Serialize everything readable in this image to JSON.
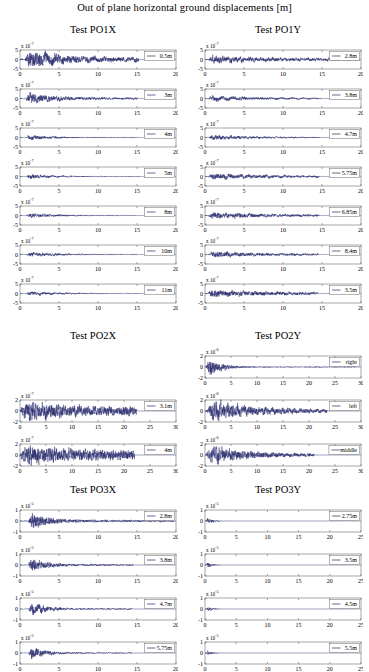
{
  "figure": {
    "title": "Out of plane horizontal ground displacements [m]",
    "axis_color": "#6b6b6b",
    "trace_color": "#27286b",
    "background": "#ffffff",
    "exp_prefix": "x 10"
  },
  "sections": [
    {
      "id": "po1x",
      "title": "Test PO1X",
      "column": "left",
      "xlabel": "",
      "ylabel": "",
      "xlim": [
        0,
        20
      ],
      "xticks": [
        0,
        5,
        10,
        15,
        20
      ],
      "ylim": [
        -5,
        5
      ],
      "yticks": [
        -5,
        0,
        5
      ],
      "exponent": "-7",
      "panels": [
        {
          "legend": "0.5m",
          "amp": 1.0,
          "burst_start": 0.7,
          "burst_peak": 1.1,
          "decay": 4.0,
          "tail": 0.22,
          "end": 15.2,
          "seed": 11
        },
        {
          "legend": "3m",
          "amp": 0.62,
          "burst_start": 0.8,
          "burst_peak": 1.2,
          "decay": 3.0,
          "tail": 0.16,
          "end": 15.1,
          "seed": 23
        },
        {
          "legend": "4m",
          "amp": 0.3,
          "burst_start": 0.8,
          "burst_peak": 1.2,
          "decay": 3.0,
          "tail": 0.12,
          "end": 15.0,
          "seed": 37
        },
        {
          "legend": "5m",
          "amp": 0.26,
          "burst_start": 0.8,
          "burst_peak": 1.2,
          "decay": 3.0,
          "tail": 0.13,
          "end": 15.3,
          "seed": 41
        },
        {
          "legend": "8m",
          "amp": 0.24,
          "burst_start": 0.8,
          "burst_peak": 1.3,
          "decay": 3.5,
          "tail": 0.14,
          "end": 15.1,
          "seed": 59
        },
        {
          "legend": "10m",
          "amp": 0.26,
          "burst_start": 0.8,
          "burst_peak": 1.3,
          "decay": 3.5,
          "tail": 0.15,
          "end": 15.0,
          "seed": 67
        },
        {
          "legend": "11m",
          "amp": 0.24,
          "burst_start": 0.8,
          "burst_peak": 1.3,
          "decay": 3.5,
          "tail": 0.14,
          "end": 15.2,
          "seed": 73
        }
      ]
    },
    {
      "id": "po1y",
      "title": "Test PO1Y",
      "column": "right",
      "xlabel": "",
      "ylabel": "",
      "xlim": [
        0,
        20
      ],
      "xticks": [
        0,
        5,
        10,
        15,
        20
      ],
      "ylim": [
        -5,
        5
      ],
      "yticks": [
        -5,
        0,
        5
      ],
      "exponent": "-7",
      "panels": [
        {
          "legend": "2.8m",
          "amp": 0.45,
          "burst_start": 0.5,
          "burst_peak": 1.0,
          "decay": 5.0,
          "tail": 0.3,
          "end": 19.8,
          "seed": 101
        },
        {
          "legend": "3.8m",
          "amp": 0.3,
          "burst_start": 0.5,
          "burst_peak": 1.0,
          "decay": 5.0,
          "tail": 0.22,
          "end": 14.8,
          "seed": 113
        },
        {
          "legend": "4.7m",
          "amp": 0.28,
          "burst_start": 0.5,
          "burst_peak": 1.0,
          "decay": 5.0,
          "tail": 0.2,
          "end": 14.7,
          "seed": 127
        },
        {
          "legend": "5.75m",
          "amp": 0.34,
          "burst_start": 0.5,
          "burst_peak": 1.0,
          "decay": 6.0,
          "tail": 0.26,
          "end": 14.6,
          "seed": 139
        },
        {
          "legend": "6.85m",
          "amp": 0.36,
          "burst_start": 0.5,
          "burst_peak": 1.0,
          "decay": 6.0,
          "tail": 0.27,
          "end": 14.6,
          "seed": 151
        },
        {
          "legend": "8.4m",
          "amp": 0.33,
          "burst_start": 0.5,
          "burst_peak": 1.0,
          "decay": 6.0,
          "tail": 0.25,
          "end": 14.5,
          "seed": 163
        },
        {
          "legend": "3.5m",
          "amp": 0.4,
          "burst_start": 0.4,
          "burst_peak": 0.9,
          "decay": 7.0,
          "tail": 0.3,
          "end": 14.5,
          "seed": 179
        }
      ]
    },
    {
      "id": "po2x",
      "title": "Test PO2X",
      "column": "left",
      "xlabel": "",
      "ylabel": "",
      "xlim": [
        0,
        30
      ],
      "xticks": [
        0,
        5,
        10,
        15,
        20,
        25,
        30
      ],
      "ylim": [
        -2,
        2
      ],
      "yticks": [
        -2,
        0,
        2
      ],
      "exponent": "-7",
      "panels": [
        {
          "legend": "3.1m",
          "amp": 0.95,
          "burst_start": 0.3,
          "burst_peak": 1.5,
          "decay": 6.0,
          "tail": 0.42,
          "end": 22.5,
          "seed": 211
        },
        {
          "legend": "4m",
          "amp": 0.95,
          "burst_start": 0.3,
          "burst_peak": 1.5,
          "decay": 6.5,
          "tail": 0.45,
          "end": 22.0,
          "seed": 223
        }
      ]
    },
    {
      "id": "po2y",
      "title": "Test PO2Y",
      "column": "right",
      "xlabel": "",
      "ylabel": "",
      "xlim": [
        0,
        30
      ],
      "xticks": [
        0,
        5,
        10,
        15,
        20,
        25,
        30
      ],
      "ylim": [
        -2,
        2
      ],
      "yticks": [
        -2,
        0,
        2
      ],
      "exponent": "-6",
      "panels": [
        {
          "legend": "right",
          "amp": 0.9,
          "burst_start": 0.2,
          "burst_peak": 0.9,
          "decay": 2.2,
          "tail": 0.05,
          "end": 29.0,
          "seed": 307
        },
        {
          "legend": "left",
          "amp": 0.85,
          "burst_start": 0.2,
          "burst_peak": 1.6,
          "decay": 9.0,
          "tail": 0.12,
          "end": 23.5,
          "seed": 311
        },
        {
          "legend": "middle",
          "amp": 0.8,
          "burst_start": 0.2,
          "burst_peak": 1.4,
          "decay": 8.0,
          "tail": 0.1,
          "end": 21.0,
          "seed": 313
        }
      ]
    },
    {
      "id": "po3x",
      "title": "Test PO3X",
      "column": "left",
      "xlabel": "",
      "ylabel": "",
      "xlim": [
        0,
        20
      ],
      "xticks": [
        0,
        5,
        10,
        15,
        20
      ],
      "ylim": [
        -1,
        1
      ],
      "yticks": [
        -1,
        0,
        1
      ],
      "exponent": "-5",
      "panels": [
        {
          "legend": "2.8m",
          "amp": 0.8,
          "burst_start": 1.1,
          "burst_peak": 1.55,
          "decay": 2.0,
          "tail": 0.13,
          "end": 19.8,
          "seed": 401
        },
        {
          "legend": "3.8m",
          "amp": 0.66,
          "burst_start": 1.1,
          "burst_peak": 1.5,
          "decay": 1.8,
          "tail": 0.11,
          "end": 14.5,
          "seed": 409
        },
        {
          "legend": "4.7m",
          "amp": 0.62,
          "burst_start": 1.1,
          "burst_peak": 1.5,
          "decay": 1.8,
          "tail": 0.1,
          "end": 14.4,
          "seed": 419
        },
        {
          "legend": "5.75m",
          "amp": 0.58,
          "burst_start": 1.1,
          "burst_peak": 1.5,
          "decay": 1.7,
          "tail": 0.09,
          "end": 14.3,
          "seed": 431
        }
      ]
    },
    {
      "id": "po3y",
      "title": "Test PO3Y",
      "column": "right",
      "xlabel": "",
      "ylabel": "",
      "xlim": [
        0,
        25
      ],
      "xticks": [
        0,
        5,
        10,
        15,
        20,
        25
      ],
      "ylim": [
        -1,
        1
      ],
      "yticks": [
        -1,
        0,
        1
      ],
      "exponent": "-5",
      "panels": [
        {
          "legend": "2.75m",
          "amp": 0.3,
          "burst_start": 0.2,
          "burst_peak": 0.45,
          "decay": 0.9,
          "tail": 0.03,
          "end": 24.8,
          "seed": 503
        },
        {
          "legend": "3.5m",
          "amp": 0.26,
          "burst_start": 0.2,
          "burst_peak": 0.45,
          "decay": 0.8,
          "tail": 0.025,
          "end": 24.6,
          "seed": 509
        },
        {
          "legend": "4.5m",
          "amp": 0.24,
          "burst_start": 0.2,
          "burst_peak": 0.45,
          "decay": 0.8,
          "tail": 0.024,
          "end": 24.6,
          "seed": 521
        },
        {
          "legend": "5.5m",
          "amp": 0.22,
          "burst_start": 0.2,
          "burst_peak": 0.45,
          "decay": 0.8,
          "tail": 0.022,
          "end": 24.5,
          "seed": 523
        }
      ]
    }
  ],
  "chart_data": {
    "type": "line",
    "title": "Out of plane horizontal ground displacements [m]",
    "xlabel": "time [s]",
    "ylabel": "displacement [m]",
    "grid": false,
    "legend_position": "upper right",
    "panel_count": 27,
    "groups": [
      {
        "name": "Test PO1X",
        "xlim": [
          0,
          20
        ],
        "xticks": [
          0,
          5,
          10,
          15,
          20
        ],
        "ylim": [
          -5,
          5
        ],
        "yticks": [
          -5,
          0,
          5
        ],
        "y_scale": "1e-7",
        "series": [
          {
            "name": "0.5m"
          },
          {
            "name": "3m"
          },
          {
            "name": "4m"
          },
          {
            "name": "5m"
          },
          {
            "name": "8m"
          },
          {
            "name": "10m"
          },
          {
            "name": "11m"
          }
        ]
      },
      {
        "name": "Test PO1Y",
        "xlim": [
          0,
          20
        ],
        "xticks": [
          0,
          5,
          10,
          15,
          20
        ],
        "ylim": [
          -5,
          5
        ],
        "yticks": [
          -5,
          0,
          5
        ],
        "y_scale": "1e-7",
        "series": [
          {
            "name": "2.8m"
          },
          {
            "name": "3.8m"
          },
          {
            "name": "4.7m"
          },
          {
            "name": "5.75m"
          },
          {
            "name": "6.85m"
          },
          {
            "name": "8.4m"
          },
          {
            "name": "3.5m"
          }
        ]
      },
      {
        "name": "Test PO2X",
        "xlim": [
          0,
          30
        ],
        "xticks": [
          0,
          5,
          10,
          15,
          20,
          25,
          30
        ],
        "ylim": [
          -2,
          2
        ],
        "yticks": [
          -2,
          0,
          2
        ],
        "y_scale": "1e-7",
        "series": [
          {
            "name": "3.1m"
          },
          {
            "name": "4m"
          }
        ]
      },
      {
        "name": "Test PO2Y",
        "xlim": [
          0,
          30
        ],
        "xticks": [
          0,
          5,
          10,
          15,
          20,
          25,
          30
        ],
        "ylim": [
          -2,
          2
        ],
        "yticks": [
          -2,
          0,
          2
        ],
        "y_scale": "1e-6",
        "series": [
          {
            "name": "right"
          },
          {
            "name": "left"
          },
          {
            "name": "middle"
          }
        ]
      },
      {
        "name": "Test PO3X",
        "xlim": [
          0,
          20
        ],
        "xticks": [
          0,
          5,
          10,
          15,
          20
        ],
        "ylim": [
          -1,
          1
        ],
        "yticks": [
          -1,
          0,
          1
        ],
        "y_scale": "1e-5",
        "series": [
          {
            "name": "2.8m"
          },
          {
            "name": "3.8m"
          },
          {
            "name": "4.7m"
          },
          {
            "name": "5.75m"
          }
        ]
      },
      {
        "name": "Test PO3Y",
        "xlim": [
          0,
          25
        ],
        "xticks": [
          0,
          5,
          10,
          15,
          20,
          25
        ],
        "ylim": [
          -1,
          1
        ],
        "yticks": [
          -1,
          0,
          1
        ],
        "y_scale": "1e-5",
        "series": [
          {
            "name": "2.75m"
          },
          {
            "name": "3.5m"
          },
          {
            "name": "4.5m"
          },
          {
            "name": "5.5m"
          }
        ]
      }
    ]
  },
  "layout": {
    "columns": {
      "left": {
        "x": 20,
        "width": 158
      },
      "right": {
        "x": 205,
        "width": 158
      }
    },
    "section_positions": [
      {
        "id": "po1x",
        "title_y": 24,
        "first_panel_y": 46,
        "panel_h": 31,
        "panel_gap": 8
      },
      {
        "id": "po1y",
        "title_y": 24,
        "first_panel_y": 46,
        "panel_h": 31,
        "panel_gap": 8
      },
      {
        "id": "po2x",
        "title_y": 330,
        "first_panel_y": 396,
        "panel_h": 34,
        "panel_gap": 10
      },
      {
        "id": "po2y",
        "title_y": 330,
        "first_panel_y": 352,
        "panel_h": 34,
        "panel_gap": 10
      },
      {
        "id": "po3x",
        "title_y": 484,
        "first_panel_y": 506,
        "panel_h": 34,
        "panel_gap": 10
      },
      {
        "id": "po3y",
        "title_y": 484,
        "first_panel_y": 506,
        "panel_h": 34,
        "panel_gap": 10
      }
    ]
  }
}
